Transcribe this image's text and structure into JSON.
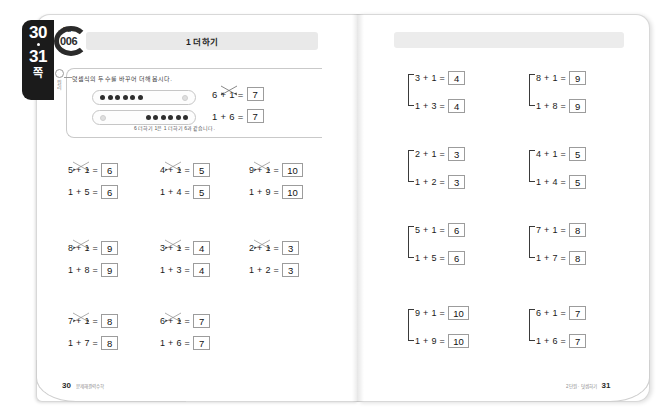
{
  "page_tab": {
    "page_start": "30",
    "page_end": "31",
    "unit_label": "쪽"
  },
  "badge": {
    "superscript": "단원",
    "number": "006"
  },
  "header": {
    "title": "1 더하기"
  },
  "example": {
    "marker_label": "원리",
    "instruction": "덧셈식의 두 수를 바꾸어 더해 봅시다.",
    "caption": "6 더하기 1은 1 더하기 6과 같습니다.",
    "dot_rows": [
      {
        "filled": 6,
        "light": 1,
        "light_position": "right"
      },
      {
        "filled": 6,
        "light": 1,
        "light_position": "left"
      }
    ],
    "equations": [
      {
        "left": "6 + 1 =",
        "answer": "7"
      },
      {
        "left": "1 + 6 =",
        "answer": "7"
      }
    ]
  },
  "left_page": {
    "rows": [
      [
        {
          "top_expr": "5 + 1 =",
          "top_answer": "6",
          "bottom_expr": "1 + 5 =",
          "bottom_answer": "6"
        },
        {
          "top_expr": "4 + 1 =",
          "top_answer": "5",
          "bottom_expr": "1 + 4 =",
          "bottom_answer": "5"
        },
        {
          "top_expr": "9 + 1 =",
          "top_answer": "10",
          "bottom_expr": "1 + 9 =",
          "bottom_answer": "10"
        }
      ],
      [
        {
          "top_expr": "8 + 1 =",
          "top_answer": "9",
          "bottom_expr": "1 + 8 =",
          "bottom_answer": "9"
        },
        {
          "top_expr": "3 + 1 =",
          "top_answer": "4",
          "bottom_expr": "1 + 3 =",
          "bottom_answer": "4"
        },
        {
          "top_expr": "2 + 1 =",
          "top_answer": "3",
          "bottom_expr": "1 + 2 =",
          "bottom_answer": "3"
        }
      ],
      [
        {
          "top_expr": "7 + 1 =",
          "top_answer": "8",
          "bottom_expr": "1 + 7 =",
          "bottom_answer": "8"
        },
        {
          "top_expr": "6 + 1 =",
          "top_answer": "7",
          "bottom_expr": "1 + 6 =",
          "bottom_answer": "7"
        }
      ]
    ]
  },
  "right_page": {
    "rows": [
      [
        {
          "top_expr": "3 + 1 =",
          "top_answer": "4",
          "bottom_expr": "1 + 3 =",
          "bottom_answer": "4"
        },
        {
          "top_expr": "8 + 1 =",
          "top_answer": "9",
          "bottom_expr": "1 + 8 =",
          "bottom_answer": "9"
        }
      ],
      [
        {
          "top_expr": "2 + 1 =",
          "top_answer": "3",
          "bottom_expr": "1 + 2 =",
          "bottom_answer": "3"
        },
        {
          "top_expr": "4 + 1 =",
          "top_answer": "5",
          "bottom_expr": "1 + 4 =",
          "bottom_answer": "5"
        }
      ],
      [
        {
          "top_expr": "5 + 1 =",
          "top_answer": "6",
          "bottom_expr": "1 + 5 =",
          "bottom_answer": "6"
        },
        {
          "top_expr": "7 + 1 =",
          "top_answer": "8",
          "bottom_expr": "1 + 7 =",
          "bottom_answer": "8"
        }
      ],
      [
        {
          "top_expr": "9 + 1 =",
          "top_answer": "10",
          "bottom_expr": "1 + 9 =",
          "bottom_answer": "10"
        },
        {
          "top_expr": "6 + 1 =",
          "top_answer": "7",
          "bottom_expr": "1 + 6 =",
          "bottom_answer": "7"
        }
      ]
    ]
  },
  "footer": {
    "left_number": "30",
    "left_text": "문제해결력수학",
    "right_number": "31",
    "right_text": "2단원 · 덧셈하기"
  },
  "colors": {
    "tab_background": "#1b1b1b",
    "title_bar": "#e9e9e9",
    "answer_box_border": "#9c9c9c",
    "dot_filled": "#2f2f2f",
    "dot_light": "#dfdfdf"
  }
}
